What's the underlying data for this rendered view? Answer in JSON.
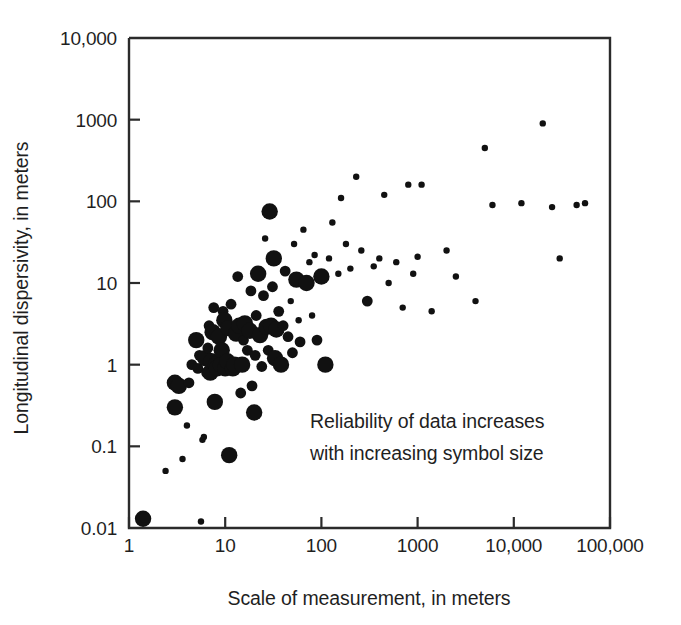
{
  "chart_data": {
    "type": "scatter",
    "title": "",
    "xlabel": "Scale of measurement, in meters",
    "ylabel": "Longitudinal dispersivity, in meters",
    "xscale": "log",
    "yscale": "log",
    "xlim": [
      1,
      100000
    ],
    "ylim": [
      0.01,
      10000
    ],
    "xticks": [
      1,
      10,
      100,
      1000,
      10000,
      100000
    ],
    "xtick_labels": [
      "1",
      "10",
      "100",
      "1000",
      "10,000",
      "100,000"
    ],
    "yticks": [
      0.01,
      0.1,
      1,
      10,
      100,
      1000,
      10000
    ],
    "ytick_labels": [
      "0.01",
      "0.1",
      "1",
      "10",
      "100",
      "1000",
      "10,000"
    ],
    "grid": false,
    "legend": null,
    "annotations": [
      {
        "name": "reliability-note",
        "line1": "Reliability of data increases",
        "line2": "with increasing symbol size",
        "x": 130,
        "y": 0.33
      }
    ],
    "size_encoding": {
      "description": "Symbol size encodes data reliability; larger symbol = more reliable data",
      "levels": [
        1,
        2,
        3
      ],
      "radii_px": [
        3.2,
        5.4,
        8.2
      ]
    },
    "point_color": "#111111",
    "points": [
      {
        "x": 1.4,
        "y": 0.013,
        "size": 3
      },
      {
        "x": 1.45,
        "y": 0.0135,
        "size": 2
      },
      {
        "x": 2.4,
        "y": 0.05,
        "size": 1
      },
      {
        "x": 3.0,
        "y": 0.3,
        "size": 3
      },
      {
        "x": 3.0,
        "y": 0.6,
        "size": 3
      },
      {
        "x": 3.3,
        "y": 0.55,
        "size": 3
      },
      {
        "x": 3.6,
        "y": 0.07,
        "size": 1
      },
      {
        "x": 4.0,
        "y": 0.18,
        "size": 1
      },
      {
        "x": 4.2,
        "y": 0.6,
        "size": 2
      },
      {
        "x": 4.5,
        "y": 1.0,
        "size": 2
      },
      {
        "x": 5.0,
        "y": 2.0,
        "size": 3
      },
      {
        "x": 5.2,
        "y": 0.9,
        "size": 2
      },
      {
        "x": 5.4,
        "y": 1.3,
        "size": 2
      },
      {
        "x": 5.6,
        "y": 0.012,
        "size": 1
      },
      {
        "x": 5.8,
        "y": 0.12,
        "size": 1
      },
      {
        "x": 6.0,
        "y": 0.13,
        "size": 1
      },
      {
        "x": 6.2,
        "y": 1.2,
        "size": 3
      },
      {
        "x": 6.4,
        "y": 0.8,
        "size": 2
      },
      {
        "x": 6.6,
        "y": 1.6,
        "size": 2
      },
      {
        "x": 6.8,
        "y": 3.0,
        "size": 2
      },
      {
        "x": 7.0,
        "y": 0.8,
        "size": 3
      },
      {
        "x": 7.2,
        "y": 1.1,
        "size": 3
      },
      {
        "x": 7.4,
        "y": 2.5,
        "size": 3
      },
      {
        "x": 7.6,
        "y": 5.0,
        "size": 2
      },
      {
        "x": 7.8,
        "y": 0.35,
        "size": 3
      },
      {
        "x": 8.0,
        "y": 1.0,
        "size": 3
      },
      {
        "x": 8.2,
        "y": 0.9,
        "size": 3
      },
      {
        "x": 8.6,
        "y": 2.2,
        "size": 3
      },
      {
        "x": 9.0,
        "y": 1.0,
        "size": 3
      },
      {
        "x": 9.2,
        "y": 1.5,
        "size": 3
      },
      {
        "x": 9.5,
        "y": 4.5,
        "size": 2
      },
      {
        "x": 9.8,
        "y": 3.5,
        "size": 3
      },
      {
        "x": 10.0,
        "y": 0.9,
        "size": 3
      },
      {
        "x": 10.5,
        "y": 1.1,
        "size": 3
      },
      {
        "x": 10.8,
        "y": 2.8,
        "size": 3
      },
      {
        "x": 11.0,
        "y": 0.078,
        "size": 3
      },
      {
        "x": 11.5,
        "y": 5.5,
        "size": 2
      },
      {
        "x": 12.0,
        "y": 0.9,
        "size": 3
      },
      {
        "x": 12.5,
        "y": 1.0,
        "size": 3
      },
      {
        "x": 13.0,
        "y": 2.4,
        "size": 3
      },
      {
        "x": 13.5,
        "y": 12.0,
        "size": 2
      },
      {
        "x": 14.0,
        "y": 3.0,
        "size": 3
      },
      {
        "x": 14.5,
        "y": 0.45,
        "size": 2
      },
      {
        "x": 15.0,
        "y": 1.0,
        "size": 3
      },
      {
        "x": 15.5,
        "y": 2.0,
        "size": 2
      },
      {
        "x": 16.0,
        "y": 3.2,
        "size": 3
      },
      {
        "x": 17.0,
        "y": 1.5,
        "size": 2
      },
      {
        "x": 18.0,
        "y": 2.6,
        "size": 3
      },
      {
        "x": 18.5,
        "y": 8.0,
        "size": 2
      },
      {
        "x": 19.0,
        "y": 0.55,
        "size": 2
      },
      {
        "x": 20.0,
        "y": 0.26,
        "size": 3
      },
      {
        "x": 20.5,
        "y": 1.3,
        "size": 2
      },
      {
        "x": 21.0,
        "y": 4.0,
        "size": 2
      },
      {
        "x": 22.0,
        "y": 13.0,
        "size": 3
      },
      {
        "x": 23.0,
        "y": 2.3,
        "size": 3
      },
      {
        "x": 24.0,
        "y": 0.95,
        "size": 2
      },
      {
        "x": 25.0,
        "y": 7.0,
        "size": 2
      },
      {
        "x": 26.0,
        "y": 35.0,
        "size": 1
      },
      {
        "x": 27.0,
        "y": 2.9,
        "size": 3
      },
      {
        "x": 28.0,
        "y": 1.5,
        "size": 2
      },
      {
        "x": 29.0,
        "y": 75.0,
        "size": 3
      },
      {
        "x": 30.0,
        "y": 3.0,
        "size": 3
      },
      {
        "x": 31.0,
        "y": 9.0,
        "size": 2
      },
      {
        "x": 32.0,
        "y": 20.0,
        "size": 3
      },
      {
        "x": 33.0,
        "y": 1.2,
        "size": 3
      },
      {
        "x": 34.0,
        "y": 2.7,
        "size": 3
      },
      {
        "x": 36.0,
        "y": 4.5,
        "size": 2
      },
      {
        "x": 38.0,
        "y": 1.0,
        "size": 3
      },
      {
        "x": 40.0,
        "y": 3.0,
        "size": 2
      },
      {
        "x": 42.0,
        "y": 14.0,
        "size": 2
      },
      {
        "x": 45.0,
        "y": 2.2,
        "size": 2
      },
      {
        "x": 48.0,
        "y": 6.0,
        "size": 1
      },
      {
        "x": 50.0,
        "y": 1.4,
        "size": 2
      },
      {
        "x": 52.0,
        "y": 30.0,
        "size": 1
      },
      {
        "x": 55.0,
        "y": 11.0,
        "size": 3
      },
      {
        "x": 58.0,
        "y": 3.5,
        "size": 1
      },
      {
        "x": 60.0,
        "y": 1.9,
        "size": 2
      },
      {
        "x": 65.0,
        "y": 45.0,
        "size": 1
      },
      {
        "x": 70.0,
        "y": 10.0,
        "size": 3
      },
      {
        "x": 75.0,
        "y": 18.0,
        "size": 1
      },
      {
        "x": 80.0,
        "y": 4.0,
        "size": 1
      },
      {
        "x": 85.0,
        "y": 22.0,
        "size": 1
      },
      {
        "x": 90.0,
        "y": 2.0,
        "size": 2
      },
      {
        "x": 100.0,
        "y": 12.0,
        "size": 3
      },
      {
        "x": 110.0,
        "y": 1.0,
        "size": 3
      },
      {
        "x": 120.0,
        "y": 20.0,
        "size": 1
      },
      {
        "x": 130.0,
        "y": 55.0,
        "size": 1
      },
      {
        "x": 150.0,
        "y": 13.0,
        "size": 1
      },
      {
        "x": 160.0,
        "y": 110.0,
        "size": 1
      },
      {
        "x": 180.0,
        "y": 30.0,
        "size": 1
      },
      {
        "x": 200.0,
        "y": 15.0,
        "size": 1
      },
      {
        "x": 230.0,
        "y": 200.0,
        "size": 1
      },
      {
        "x": 260.0,
        "y": 25.0,
        "size": 1
      },
      {
        "x": 300.0,
        "y": 6.0,
        "size": 2
      },
      {
        "x": 350.0,
        "y": 16.0,
        "size": 1
      },
      {
        "x": 400.0,
        "y": 20.0,
        "size": 1
      },
      {
        "x": 450.0,
        "y": 120.0,
        "size": 1
      },
      {
        "x": 500.0,
        "y": 10.0,
        "size": 1
      },
      {
        "x": 600.0,
        "y": 18.0,
        "size": 1
      },
      {
        "x": 700.0,
        "y": 5.0,
        "size": 1
      },
      {
        "x": 800.0,
        "y": 160.0,
        "size": 1
      },
      {
        "x": 900.0,
        "y": 13.0,
        "size": 1
      },
      {
        "x": 1000.0,
        "y": 21.0,
        "size": 1
      },
      {
        "x": 1100.0,
        "y": 160.0,
        "size": 1
      },
      {
        "x": 1400.0,
        "y": 4.5,
        "size": 1
      },
      {
        "x": 2000.0,
        "y": 25.0,
        "size": 1
      },
      {
        "x": 2500.0,
        "y": 12.0,
        "size": 1
      },
      {
        "x": 4000.0,
        "y": 6.0,
        "size": 1
      },
      {
        "x": 5000.0,
        "y": 450.0,
        "size": 1
      },
      {
        "x": 6000.0,
        "y": 90.0,
        "size": 1
      },
      {
        "x": 12000.0,
        "y": 95.0,
        "size": 1
      },
      {
        "x": 20000.0,
        "y": 900.0,
        "size": 1
      },
      {
        "x": 25000.0,
        "y": 85.0,
        "size": 1
      },
      {
        "x": 30000.0,
        "y": 20.0,
        "size": 1
      },
      {
        "x": 45000.0,
        "y": 90.0,
        "size": 1
      },
      {
        "x": 55000.0,
        "y": 95.0,
        "size": 1
      }
    ]
  }
}
